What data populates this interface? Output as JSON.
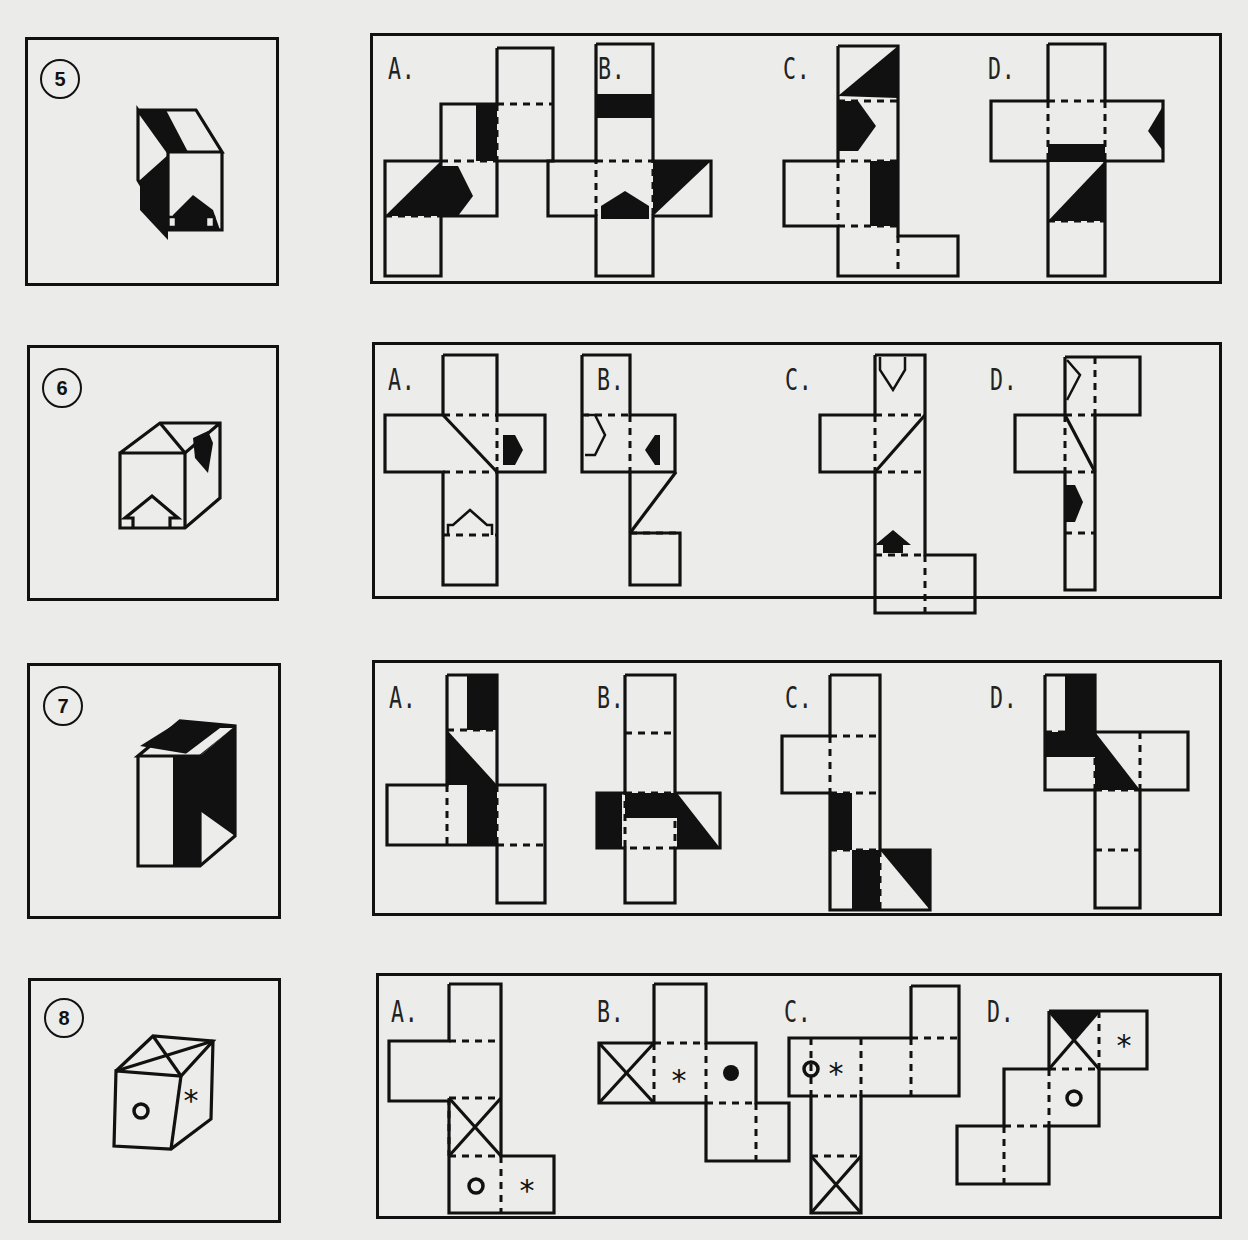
{
  "questions": [
    {
      "number": "5",
      "options": [
        "A.",
        "B.",
        "C.",
        "D."
      ],
      "cube_faces": [
        "diagonal black band on top",
        "black triangle on left face",
        "black arrow on front face pointing up"
      ]
    },
    {
      "number": "6",
      "options": [
        "A.",
        "B.",
        "C.",
        "D."
      ],
      "cube_faces": [
        "diagonal line on top",
        "black arrow on right face",
        "outlined arrow on front face pointing up"
      ]
    },
    {
      "number": "7",
      "options": [
        "A.",
        "B.",
        "C.",
        "D."
      ],
      "cube_faces": [
        "black top with white stripe",
        "black vertical band on front",
        "black triangle on right face"
      ]
    },
    {
      "number": "8",
      "options": [
        "A.",
        "B.",
        "C.",
        "D."
      ],
      "cube_faces": [
        "X on top",
        "circle on front",
        "asterisk on right face"
      ]
    }
  ],
  "symbols": {
    "circle": "o",
    "asterisk": "*"
  },
  "colors": {
    "ink": "#111111",
    "paper": "#ebebe9"
  }
}
